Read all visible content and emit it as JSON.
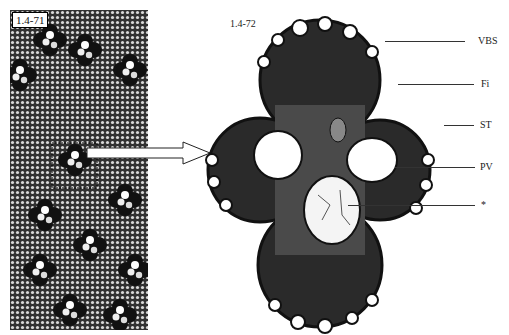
{
  "figure": {
    "left_panel": {
      "label": "1.4-71",
      "description": "Low-magnification cross section showing scattered vascular bundles in ground tissue",
      "inset_box": true
    },
    "right_panel": {
      "label": "1.4-72",
      "description": "Enlarged vascular bundle cross section"
    },
    "annotations": [
      {
        "id": "vbs",
        "text": "VBS"
      },
      {
        "id": "fi",
        "text": "Fi"
      },
      {
        "id": "st",
        "text": "ST"
      },
      {
        "id": "pv",
        "text": "PV"
      },
      {
        "id": "star",
        "text": "*"
      }
    ],
    "colors": {
      "background": "#ffffff",
      "tissue_dark": "#1e1e1e",
      "cell_light": "#f2f2f2",
      "ground_tissue": "#3a3a3a"
    }
  }
}
